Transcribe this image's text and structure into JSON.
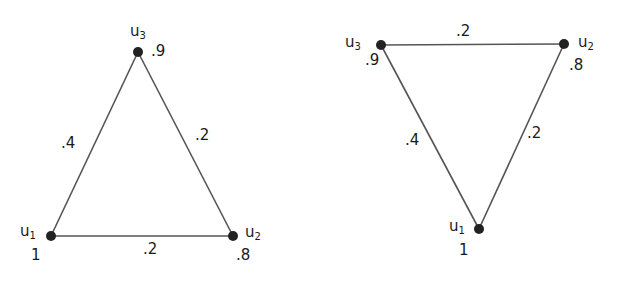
{
  "graphs": [
    {
      "nodes": [
        {
          "id": "u1",
          "name": "u",
          "sub": "1",
          "weight": "1",
          "x": 51,
          "y": 236
        },
        {
          "id": "u2",
          "name": "u",
          "sub": "2",
          "weight": ".8",
          "x": 233,
          "y": 236
        },
        {
          "id": "u3",
          "name": "u",
          "sub": "3",
          "weight": ".9",
          "x": 138,
          "y": 52
        }
      ],
      "edges": [
        {
          "from": "u1",
          "to": "u3",
          "weight": ".4"
        },
        {
          "from": "u3",
          "to": "u2",
          "weight": ".2"
        },
        {
          "from": "u1",
          "to": "u2",
          "weight": ".2"
        }
      ]
    },
    {
      "nodes": [
        {
          "id": "u1",
          "name": "u",
          "sub": "1",
          "weight": "1",
          "x": 479,
          "y": 229
        },
        {
          "id": "u2",
          "name": "u",
          "sub": "2",
          "weight": ".8",
          "x": 564,
          "y": 44
        },
        {
          "id": "u3",
          "name": "u",
          "sub": "3",
          "weight": ".9",
          "x": 381,
          "y": 45
        }
      ],
      "edges": [
        {
          "from": "u3",
          "to": "u2",
          "weight": ".2"
        },
        {
          "from": "u3",
          "to": "u1",
          "weight": ".4"
        },
        {
          "from": "u2",
          "to": "u1",
          "weight": ".2"
        }
      ]
    }
  ],
  "colors": {
    "edge": "#555555",
    "node": "#222222",
    "text": "#1a1a1a"
  }
}
